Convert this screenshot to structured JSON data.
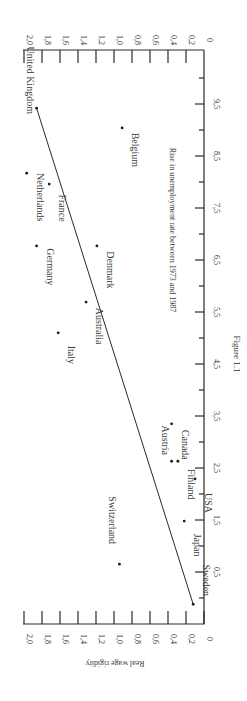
{
  "figure_caption": "Figure 1.1",
  "chart_data": {
    "type": "scatter",
    "title": "",
    "orientation": "rotated 90° clockwise on page",
    "xlabel": "Rise in unemployment rate between 1973 and 1987",
    "ylabel": "Real wage rigidity",
    "xlim": [
      -0.5,
      10.0
    ],
    "ylim": [
      0,
      2.0
    ],
    "x_ticks": [
      "0,5",
      "1,5",
      "2,5",
      "3,5",
      "4,5",
      "5,5",
      "6,5",
      "7,5",
      "8,5",
      "9,5"
    ],
    "x_tick_values": [
      0.5,
      1.5,
      2.5,
      3.5,
      4.5,
      5.5,
      6.5,
      7.5,
      8.5,
      9.5
    ],
    "x_minor_tick_values": [
      0,
      1,
      2,
      3,
      4,
      5,
      6,
      7,
      8,
      9,
      10
    ],
    "y_ticks": [
      "0",
      "0,2",
      "0,4",
      "0,6",
      "0,8",
      "1,0",
      "1,2",
      "1,4",
      "1,6",
      "1,8",
      "2,0"
    ],
    "y_tick_values": [
      0,
      0.2,
      0.4,
      0.6,
      0.8,
      1.0,
      1.2,
      1.4,
      1.6,
      1.8,
      2.0
    ],
    "grid": false,
    "legend": null,
    "points": [
      {
        "label": "Sweden",
        "x": -0.12,
        "y": 0.12
      },
      {
        "label": "Switzerland",
        "x": 0.65,
        "y": 0.94
      },
      {
        "label": "Japan",
        "x": 1.48,
        "y": 0.22
      },
      {
        "label": "USA",
        "x": 2.29,
        "y": 0.1
      },
      {
        "label": "Finland",
        "x": 2.63,
        "y": 0.29
      },
      {
        "label": "Austria",
        "x": 2.63,
        "y": 0.36
      },
      {
        "label": "Canada",
        "x": 3.35,
        "y": 0.36
      },
      {
        "label": "Italy",
        "x": 5.1,
        "y": 1.62
      },
      {
        "label": "Australia",
        "x": 5.69,
        "y": 1.31
      },
      {
        "label": "Germany",
        "x": 6.77,
        "y": 1.86
      },
      {
        "label": "Denmark",
        "x": 6.77,
        "y": 1.19
      },
      {
        "label": "France",
        "x": 7.96,
        "y": 1.72
      },
      {
        "label": "Netherlands",
        "x": 8.17,
        "y": 1.97
      },
      {
        "label": "Belgium",
        "x": 9.04,
        "y": 0.91
      },
      {
        "label": "United Kingdom",
        "x": 9.42,
        "y": 1.86
      }
    ],
    "regression_line": {
      "x": [
        -0.12,
        9.42
      ],
      "y": [
        0.12,
        1.86
      ]
    },
    "label_offsets": {
      "Sweden": [
        -24,
        -10
      ],
      "Switzerland": [
        4,
        -30
      ],
      "Japan": [
        -14,
        10
      ],
      "USA": [
        -14,
        10
      ],
      "Finland": [
        -14,
        9
      ],
      "Austria": [
        24,
        -7
      ],
      "Canada": [
        -14,
        7
      ],
      "Italy": [
        -14,
        8
      ],
      "Australia": [
        -14,
        10
      ],
      "Germany": [
        -14,
        7
      ],
      "Denmark": [
        -14,
        10
      ],
      "France": [
        -14,
        10
      ],
      "Netherlands": [
        -14,
        10
      ],
      "Belgium": [
        -14,
        8
      ],
      "United Kingdom": [
        43,
        -14
      ]
    }
  }
}
